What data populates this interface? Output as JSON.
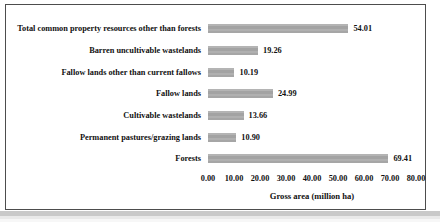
{
  "chart_data": {
    "type": "bar",
    "orientation": "horizontal",
    "categories": [
      "Total common property resources other than forests",
      "Barren uncultivable wastelands",
      "Fallow lands other than current fallows",
      "Fallow lands",
      "Cultivable wastelands",
      "Permanent pastures/grazing lands",
      "Forests"
    ],
    "values": [
      54.01,
      19.26,
      10.19,
      24.99,
      13.66,
      10.9,
      69.41
    ],
    "value_labels": [
      "54.01",
      "19.26",
      "10.19",
      "24.99",
      "13.66",
      "10.90",
      "69.41"
    ],
    "xlabel": "Gross area (million ha)",
    "xlim": [
      0,
      80
    ],
    "xticks": [
      "0.00",
      "10.00",
      "20.00",
      "30.00",
      "40.00",
      "50.00",
      "60.00",
      "70.00",
      "80.00"
    ],
    "grid": false,
    "legend": false,
    "bar_color": "#ababab",
    "text_color": "#111111",
    "frame_border_color": "#4d4d4d"
  }
}
